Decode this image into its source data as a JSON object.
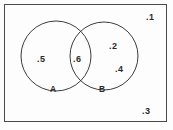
{
  "figure": {
    "kind": "venn-diagram",
    "background_color": "#fdfdfd",
    "stroke_color": "#4a4a4a",
    "text_color": "#2b2b2b"
  },
  "universe": {
    "name": "universal-set-rectangle",
    "x": 4,
    "y": 4,
    "width": 162,
    "height": 117
  },
  "sets": [
    {
      "id": "A",
      "label": "A",
      "cx": 56,
      "cy": 56,
      "r": 35,
      "label_x": 50,
      "label_y": 85
    },
    {
      "id": "B",
      "label": "B",
      "cx": 104,
      "cy": 56,
      "r": 34,
      "label_x": 99,
      "label_y": 85
    }
  ],
  "points": [
    {
      "label": ".1",
      "region": "outside-both",
      "x": 146,
      "y": 13
    },
    {
      "label": ".5",
      "region": "A-only",
      "x": 37,
      "y": 55
    },
    {
      "label": ".6",
      "region": "A-and-B",
      "x": 73,
      "y": 55
    },
    {
      "label": ".2",
      "region": "B-only",
      "x": 109,
      "y": 42
    },
    {
      "label": ".4",
      "region": "B-only",
      "x": 115,
      "y": 65
    },
    {
      "label": ".3",
      "region": "outside-both",
      "x": 142,
      "y": 107
    }
  ]
}
